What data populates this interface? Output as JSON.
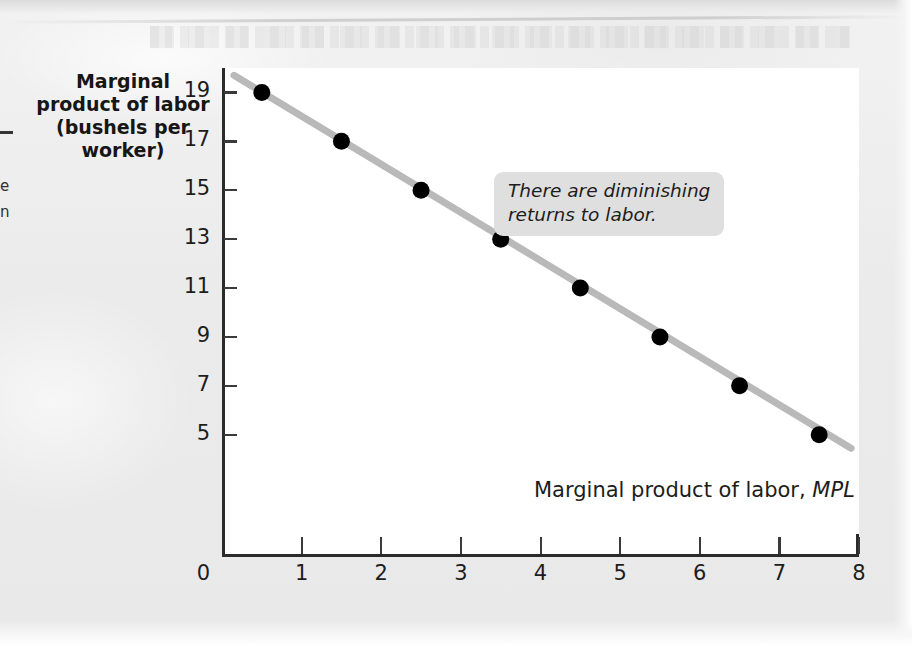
{
  "page": {
    "background_color": "#ededed",
    "panel_color": "#ffffff"
  },
  "margin_fragments": {
    "dash": "",
    "frag_top": "e",
    "frag_bottom": "n"
  },
  "chart_data": {
    "type": "scatter",
    "title": "",
    "xlabel": "Quantity of labor (workers)",
    "ylabel": "Marginal product of labor\n(bushels per\nworker)",
    "ylabel_lines": [
      "Marginal",
      "product of labor",
      "(bushels per",
      "worker)"
    ],
    "xlim": [
      0,
      8
    ],
    "ylim": [
      0,
      20
    ],
    "grid": false,
    "legend": "none",
    "x_ticks": [
      0,
      1,
      2,
      3,
      4,
      5,
      6,
      7,
      8
    ],
    "x_tick_labels": [
      "0",
      "1",
      "2",
      "3",
      "4",
      "5",
      "6",
      "7",
      "8"
    ],
    "y_ticks": [
      19,
      17,
      15,
      13,
      11,
      9,
      7,
      5
    ],
    "y_tick_labels": [
      "19",
      "17",
      "15",
      "13",
      "11",
      "9",
      "7",
      "5"
    ],
    "y_origin_label": "0",
    "series": [
      {
        "name": "Marginal product of labor, MPL",
        "marker": "filled-circle",
        "marker_color": "#000000",
        "line_color": "#b9b9b9",
        "line_width": 7,
        "x": [
          0.5,
          1.5,
          2.5,
          3.5,
          4.5,
          5.5,
          6.5,
          7.5
        ],
        "y": [
          19.0,
          17.0,
          15.0,
          13.0,
          11.0,
          9.0,
          7.0,
          5.0
        ]
      }
    ],
    "line_endpoints": {
      "start": [
        0.15,
        19.7
      ],
      "end": [
        7.9,
        4.45
      ]
    },
    "annotations": [
      {
        "name": "diminishing-returns-note",
        "text": "There are diminishing\nreturns to labor.",
        "style": "italic",
        "background_color": "#dfdfdf",
        "x_data": 3.6,
        "y_data": 19.4
      },
      {
        "name": "curve-label",
        "text_plain": "Marginal product of labor, ",
        "text_symbol": "MPL",
        "style": "roman-with-italic-symbol",
        "x_data": 4.0,
        "y_data": 4.2
      }
    ]
  }
}
